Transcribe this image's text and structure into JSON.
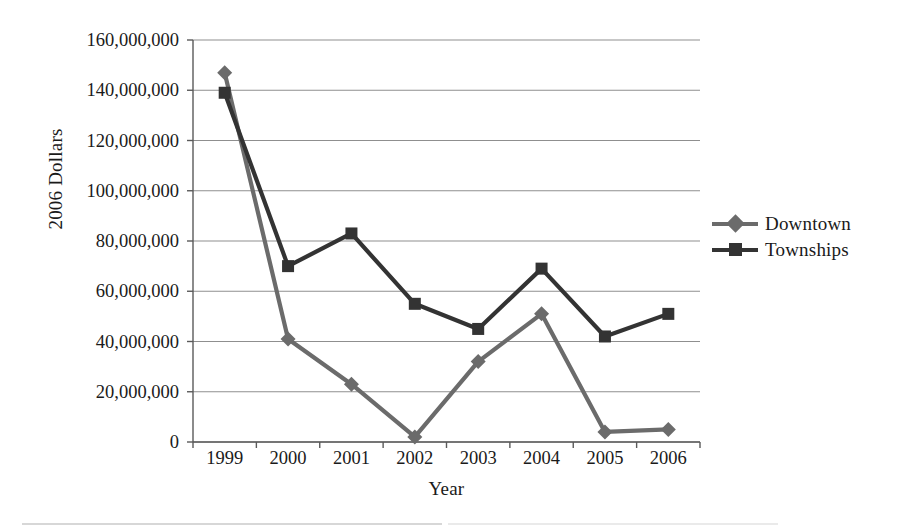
{
  "chart_data": {
    "type": "line",
    "title": "",
    "xlabel": "Year",
    "ylabel": "2006 Dollars",
    "categories": [
      "1999",
      "2000",
      "2001",
      "2002",
      "2003",
      "2004",
      "2005",
      "2006"
    ],
    "ylim": [
      0,
      160000000
    ],
    "ytick_values": [
      0,
      20000000,
      40000000,
      60000000,
      80000000,
      100000000,
      120000000,
      140000000,
      160000000
    ],
    "ytick_labels": [
      "0",
      "20,000,000",
      "40,000,000",
      "60,000,000",
      "80,000,000",
      "100,000,000",
      "120,000,000",
      "140,000,000",
      "160,000,000"
    ],
    "grid": "horizontal",
    "legend_position": "right",
    "series": [
      {
        "name": "Downtown",
        "marker": "diamond",
        "color": "#6b6b6b",
        "values": [
          147000000,
          41000000,
          23000000,
          2000000,
          32000000,
          51000000,
          4000000,
          5000000
        ]
      },
      {
        "name": "Townships",
        "marker": "square",
        "color": "#333333",
        "values": [
          139000000,
          70000000,
          83000000,
          55000000,
          45000000,
          69000000,
          42000000,
          51000000
        ]
      }
    ]
  },
  "colors": {
    "downtown": "#6b6b6b",
    "townships": "#333333",
    "gridline": "#8f8f8f",
    "axis": "#5a5a5a",
    "text": "#1a1a1a"
  },
  "plot_geometry": {
    "left": 193,
    "right": 700,
    "top": 40,
    "bottom": 442
  }
}
